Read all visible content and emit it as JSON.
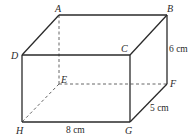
{
  "diagram": {
    "type": "cuboid",
    "vertices": {
      "A": {
        "label": "A",
        "x": 59,
        "y": 15
      },
      "B": {
        "label": "B",
        "x": 167,
        "y": 15
      },
      "C": {
        "label": "C",
        "x": 130,
        "y": 55
      },
      "D": {
        "label": "D",
        "x": 22,
        "y": 55
      },
      "E": {
        "label": "E",
        "x": 59,
        "y": 84
      },
      "F": {
        "label": "F",
        "x": 167,
        "y": 84
      },
      "G": {
        "label": "G",
        "x": 130,
        "y": 122
      },
      "H": {
        "label": "H",
        "x": 22,
        "y": 122
      }
    },
    "visible_edges": [
      "AB",
      "AD",
      "BC",
      "DC",
      "BF",
      "CG",
      "DH",
      "HG",
      "GF"
    ],
    "hidden_edges": [
      "AE",
      "EF",
      "EH"
    ],
    "dimensions": {
      "length": "8 cm",
      "height": "6 cm",
      "width": "5 cm"
    }
  }
}
